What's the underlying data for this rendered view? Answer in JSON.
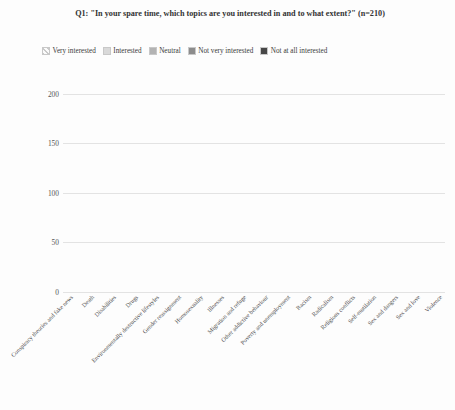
{
  "chart_data": {
    "type": "bar",
    "subtype": "stacked-vertical",
    "title": "Q1: \"In your spare time, which topics are you interested in and to what extent?\" (n=210)",
    "xlabel": "",
    "ylabel": "",
    "ylim": [
      0,
      210
    ],
    "yticks": [
      0,
      50,
      100,
      150,
      200
    ],
    "grid": true,
    "legend_position": "top",
    "n": 210,
    "categories": [
      "Conspiracy theories and fake news",
      "Death",
      "Disabilities",
      "Drugs",
      "Environmentally destructive lifestyles",
      "Gender reassignment",
      "Homosexuality",
      "Illnesses",
      "Migration and refuge",
      "Other addictive behaviour",
      "Poverty and unemployment",
      "Racism",
      "Radicalism",
      "Religious conflicts",
      "Self-mutilation",
      "Sex and dangers",
      "Sex and love",
      "Violence"
    ],
    "series": [
      {
        "name": "Very interested",
        "color": "#f2f2f2",
        "pattern": "diagonal-hatch",
        "values": [
          35,
          35,
          33,
          30,
          65,
          35,
          38,
          60,
          35,
          25,
          42,
          100,
          42,
          42,
          42,
          45,
          52,
          30
        ]
      },
      {
        "name": "Interested",
        "color": "#d9d9d9",
        "pattern": "solid",
        "values": [
          65,
          85,
          70,
          53,
          78,
          57,
          82,
          80,
          75,
          95,
          88,
          55,
          90,
          70,
          68,
          88,
          83,
          92
        ]
      },
      {
        "name": "Neutral",
        "color": "#b3b3b3",
        "pattern": "solid",
        "values": [
          52,
          40,
          37,
          42,
          25,
          60,
          38,
          30,
          32,
          35,
          42,
          30,
          36,
          53,
          30,
          39,
          43,
          56
        ]
      },
      {
        "name": "Not very interested",
        "color": "#8c8c8c",
        "pattern": "solid",
        "values": [
          30,
          26,
          28,
          48,
          22,
          26,
          27,
          20,
          34,
          27,
          20,
          18,
          22,
          27,
          37,
          20,
          18,
          18
        ]
      },
      {
        "name": "Not at all interested",
        "color": "#474747",
        "pattern": "solid",
        "values": [
          28,
          24,
          42,
          37,
          20,
          32,
          25,
          20,
          34,
          28,
          18,
          7,
          20,
          18,
          33,
          18,
          14,
          14
        ]
      }
    ],
    "totals": [
      210,
      210,
      210,
      210,
      210,
      210,
      210,
      210,
      210,
      210,
      210,
      210,
      210,
      210,
      210,
      210,
      210,
      210
    ]
  }
}
